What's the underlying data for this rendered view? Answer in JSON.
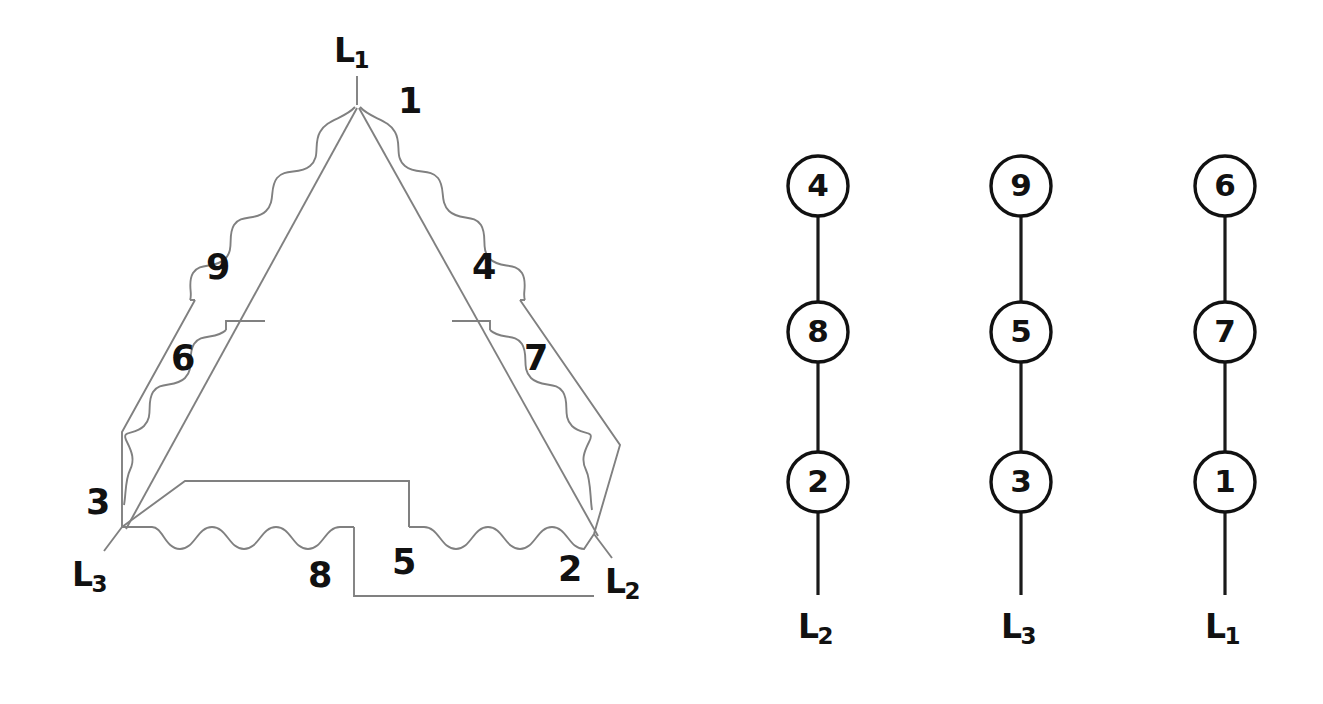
{
  "figure": {
    "line_color": "#808080",
    "lead_color": "#1a1a1a",
    "label_color": "#111111",
    "background": "#ffffff"
  },
  "delta_diagram": {
    "name": "delta-winding-schematic",
    "terminals": [
      {
        "id": "L1",
        "letter": "L",
        "sub": "1",
        "x": 334,
        "y": 34
      },
      {
        "id": "L3",
        "letter": "L",
        "sub": "3",
        "x": 72,
        "y": 558
      },
      {
        "id": "L2",
        "letter": "L",
        "sub": "2",
        "x": 605,
        "y": 565
      }
    ],
    "coil_labels": [
      {
        "text": "1",
        "x": 398,
        "y": 84
      },
      {
        "text": "9",
        "x": 206,
        "y": 250
      },
      {
        "text": "4",
        "x": 472,
        "y": 250
      },
      {
        "text": "6",
        "x": 171,
        "y": 341
      },
      {
        "text": "7",
        "x": 524,
        "y": 341
      },
      {
        "text": "3",
        "x": 86,
        "y": 485
      },
      {
        "text": "8",
        "x": 308,
        "y": 558
      },
      {
        "text": "5",
        "x": 392,
        "y": 545
      },
      {
        "text": "2",
        "x": 558,
        "y": 552
      }
    ],
    "junctions": [
      {
        "label": "1",
        "x": 357,
        "y": 105
      },
      {
        "label": "3",
        "x": 122,
        "y": 527
      },
      {
        "label": "2",
        "x": 592,
        "y": 533
      }
    ]
  },
  "lead_groups": {
    "name": "lead-connection-groups",
    "columns": [
      {
        "center_x": 818,
        "terminal": {
          "id": "L2",
          "letter": "L",
          "sub": "2",
          "x": 798,
          "y": 610
        },
        "nodes": [
          {
            "text": "4",
            "cy": 186
          },
          {
            "text": "8",
            "cy": 332
          },
          {
            "text": "2",
            "cy": 482
          }
        ]
      },
      {
        "center_x": 1021,
        "terminal": {
          "id": "L3",
          "letter": "L",
          "sub": "3",
          "x": 1001,
          "y": 610
        },
        "nodes": [
          {
            "text": "9",
            "cy": 186
          },
          {
            "text": "5",
            "cy": 332
          },
          {
            "text": "3",
            "cy": 482
          }
        ]
      },
      {
        "center_x": 1225,
        "terminal": {
          "id": "L1",
          "letter": "L",
          "sub": "1",
          "x": 1205,
          "y": 610
        },
        "nodes": [
          {
            "text": "6",
            "cy": 186
          },
          {
            "text": "7",
            "cy": 332
          },
          {
            "text": "1",
            "cy": 482
          }
        ]
      }
    ],
    "node_radius": 30,
    "lead_bottom_y": 595
  }
}
